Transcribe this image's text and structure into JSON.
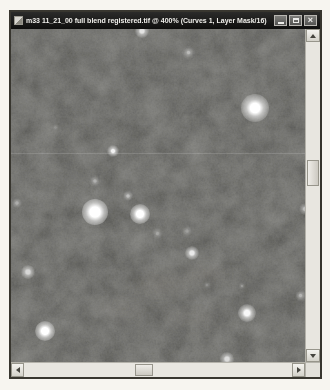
{
  "window": {
    "title": "m33 11_21_00 full blend registered.tif @ 400% (Curves 1, Layer Mask/16)",
    "zoom_percent": "400%",
    "controls": {
      "close_glyph": "×"
    }
  },
  "canvas": {
    "type": "astrophoto-starfield",
    "base_color": "#0d0d0c",
    "artifact_line": {
      "y": 124,
      "opacity": 0.14
    },
    "stars": [
      {
        "x": 131,
        "y": 2,
        "core": 2.5,
        "glow": 7,
        "b": 0.8
      },
      {
        "x": 177,
        "y": 23,
        "core": 1.5,
        "glow": 6.5,
        "b": 0.5
      },
      {
        "x": 244,
        "y": 79,
        "core": 6,
        "glow": 14,
        "b": 1
      },
      {
        "x": 102,
        "y": 122,
        "core": 2,
        "glow": 6,
        "b": 0.9
      },
      {
        "x": 84,
        "y": 152,
        "core": 1.5,
        "glow": 6,
        "b": 0.45
      },
      {
        "x": 117,
        "y": 167,
        "core": 1.5,
        "glow": 5,
        "b": 0.55
      },
      {
        "x": 84,
        "y": 183,
        "core": 6.5,
        "glow": 13,
        "b": 1
      },
      {
        "x": 129,
        "y": 185,
        "core": 4.5,
        "glow": 10,
        "b": 1
      },
      {
        "x": 146,
        "y": 204,
        "core": 1.5,
        "glow": 5.5,
        "b": 0.35
      },
      {
        "x": 6,
        "y": 174,
        "core": 1.5,
        "glow": 5,
        "b": 0.4
      },
      {
        "x": 294,
        "y": 180,
        "core": 2,
        "glow": 6,
        "b": 0.55
      },
      {
        "x": 176,
        "y": 202,
        "core": 1.5,
        "glow": 5,
        "b": 0.3
      },
      {
        "x": 181,
        "y": 224,
        "core": 2.5,
        "glow": 7,
        "b": 0.85
      },
      {
        "x": 17,
        "y": 243,
        "core": 2.5,
        "glow": 7,
        "b": 0.7
      },
      {
        "x": 34,
        "y": 302,
        "core": 4.5,
        "glow": 10,
        "b": 1
      },
      {
        "x": 236,
        "y": 284,
        "core": 3.5,
        "glow": 9,
        "b": 0.95
      },
      {
        "x": 289,
        "y": 266,
        "core": 1.5,
        "glow": 5.5,
        "b": 0.45
      },
      {
        "x": 216,
        "y": 330,
        "core": 2.5,
        "glow": 7,
        "b": 0.75
      },
      {
        "x": 196,
        "y": 256,
        "core": 1,
        "glow": 4,
        "b": 0.25
      },
      {
        "x": 231,
        "y": 257,
        "core": 1,
        "glow": 4,
        "b": 0.3
      },
      {
        "x": 44,
        "y": 98,
        "core": 1,
        "glow": 3.5,
        "b": 0.2
      }
    ],
    "nebula_patches": [
      {
        "x": 150,
        "y": 255,
        "rx": 55,
        "ry": 22,
        "a": 0.1,
        "rgb": "150,135,120"
      },
      {
        "x": 195,
        "y": 245,
        "rx": 35,
        "ry": 16,
        "a": 0.12,
        "rgb": "150,135,120"
      },
      {
        "x": 110,
        "y": 280,
        "rx": 45,
        "ry": 18,
        "a": 0.08,
        "rgb": "145,130,118"
      },
      {
        "x": 180,
        "y": 288,
        "rx": 50,
        "ry": 20,
        "a": 0.07,
        "rgb": "145,130,118"
      },
      {
        "x": 60,
        "y": 150,
        "rx": 40,
        "ry": 25,
        "a": 0.05,
        "rgb": "140,140,135"
      }
    ]
  },
  "scrollbars": {
    "vertical": {
      "thumb_top": 131,
      "thumb_height": 26
    },
    "horizontal": {
      "thumb_left": 124,
      "thumb_width": 18
    }
  },
  "colors": {
    "titlebar": "#141413",
    "page_bg": "#f7f5f0",
    "scroll_track": "#e8e6e0",
    "button_face": "#dcdad4",
    "window_border": "#38362f"
  }
}
